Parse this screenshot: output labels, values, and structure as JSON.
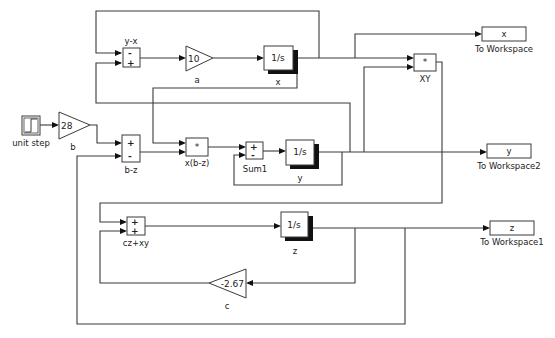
{
  "diagram": {
    "colors": {
      "wire": "#3a3a3a",
      "block_fill": "#ffffff",
      "shadow": "#111111",
      "text": "#222222"
    }
  },
  "blocks": {
    "sum_yx": {
      "label": "y-x",
      "signs": [
        "-",
        "+"
      ]
    },
    "gain_a": {
      "value": "10",
      "label": "a"
    },
    "integ_x": {
      "value": "1/s",
      "label": "x"
    },
    "product_xy": {
      "value": "*",
      "label": "XY"
    },
    "ws_x": {
      "value": "x",
      "label": "To Workspace"
    },
    "unit_step": {
      "label": "unit step"
    },
    "gain_b": {
      "value": "28",
      "label": "b"
    },
    "sum_bz": {
      "label": "b-z",
      "signs": [
        "+",
        "-"
      ]
    },
    "product_xbz": {
      "value": "*",
      "label": "x(b-z)"
    },
    "sum1": {
      "label": "Sum1",
      "signs": [
        "+",
        "-"
      ]
    },
    "integ_y": {
      "value": "1/s",
      "label": "y"
    },
    "ws_y": {
      "value": "y",
      "label": "To Workspace2"
    },
    "sum_czxy": {
      "label": "cz+xy",
      "signs": [
        "+",
        "+"
      ]
    },
    "integ_z": {
      "value": "1/s",
      "label": "z"
    },
    "ws_z": {
      "value": "z",
      "label": "To Workspace1"
    },
    "gain_c": {
      "value": "-2.67",
      "label": "c"
    }
  }
}
